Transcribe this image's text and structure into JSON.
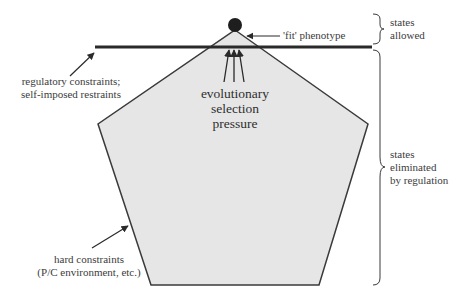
{
  "diagram": {
    "type": "constraint-space-diagram",
    "colors": {
      "pentagon_fill": "#e6e6e6",
      "pentagon_stroke": "#3a3a3a",
      "bar": "#2a2a2a",
      "dot": "#1e1e1e",
      "text": "#3c3c3c"
    },
    "labels": {
      "fit_phenotype": "'fit' phenotype",
      "states_allowed": [
        "states",
        "allowed"
      ],
      "regulatory": [
        "regulatory constraints;",
        "self-imposed restraints"
      ],
      "selection": [
        "evolutionary",
        "selection",
        "pressure"
      ],
      "states_eliminated": [
        "states",
        "eliminated",
        "by regulation"
      ],
      "hard_constraints": [
        "hard constraints",
        "(P/C environment, etc.)"
      ]
    },
    "shapes": {
      "pentagon_points": [
        [
          235,
          30
        ],
        [
          368,
          124
        ],
        [
          319,
          285
        ],
        [
          151,
          285
        ],
        [
          98,
          124
        ]
      ],
      "regulation_bar": {
        "x1": 95,
        "x2": 372,
        "y": 47
      },
      "fit_dot": {
        "cx": 235,
        "cy": 25,
        "r": 7
      }
    }
  }
}
